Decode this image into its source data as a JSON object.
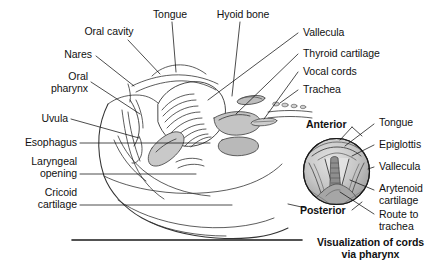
{
  "figure": {
    "title_caption": "Visualization of cords\nvia pharynx",
    "caption_line1": "Visualization of cords",
    "caption_line2": "via pharynx"
  },
  "main_diagram": {
    "description": "Sagittal section of head and neck airway anatomy",
    "labels_top": [
      {
        "id": "oral-cavity",
        "text": "Oral cavity"
      },
      {
        "id": "tongue",
        "text": "Tongue"
      },
      {
        "id": "hyoid-bone",
        "text": "Hyoid bone"
      }
    ],
    "labels_left": [
      {
        "id": "nares",
        "text": "Nares"
      },
      {
        "id": "oral-pharynx",
        "line1": "Oral",
        "line2": "pharynx"
      },
      {
        "id": "uvula",
        "text": "Uvula"
      },
      {
        "id": "esophagus",
        "text": "Esophagus"
      },
      {
        "id": "laryngeal-opening",
        "line1": "Laryngeal",
        "line2": "opening"
      },
      {
        "id": "cricoid-cartilage",
        "line1": "Cricoid",
        "line2": "cartilage"
      }
    ],
    "labels_right": [
      {
        "id": "vallecula",
        "text": "Vallecula"
      },
      {
        "id": "thyroid-cartilage",
        "text": "Thyroid cartilage"
      },
      {
        "id": "vocal-cords",
        "text": "Vocal cords"
      },
      {
        "id": "trachea",
        "text": "Trachea"
      }
    ]
  },
  "inset_diagram": {
    "orientation_top": "Anterior",
    "orientation_bottom": "Posterior",
    "labels": [
      {
        "id": "inset-tongue",
        "text": "Tongue"
      },
      {
        "id": "inset-epiglottis",
        "text": "Epiglottis"
      },
      {
        "id": "inset-vallecula",
        "text": "Vallecula"
      },
      {
        "id": "inset-arytenoid-cartilage",
        "line1": "Arytenoid",
        "line2": "cartilage"
      },
      {
        "id": "inset-route-to-trachea",
        "line1": "Route to",
        "line2": "trachea"
      }
    ]
  },
  "colors": {
    "ink": "#111111",
    "line": "#333333",
    "shade_light": "#d8d8d8",
    "shade_mid": "#b4b4b4",
    "shade_dark": "#8a8a8a",
    "background": "#ffffff"
  }
}
